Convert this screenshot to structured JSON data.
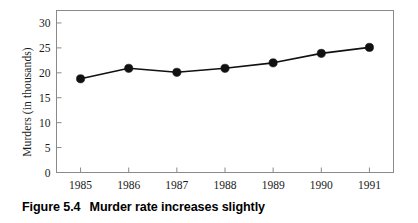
{
  "figure": {
    "caption_number": "Figure 5.4",
    "caption_text": "Murder rate increases slightly"
  },
  "axes": {
    "y_title": "Murders (in thousands)",
    "y_ticks": [
      "0",
      "5",
      "10",
      "15",
      "20",
      "25",
      "30"
    ],
    "x_ticks": [
      "1985",
      "1986",
      "1987",
      "1988",
      "1989",
      "1990",
      "1991"
    ]
  },
  "colors": {
    "frame": "#8a8a8a",
    "line": "#111111",
    "marker": "#111111",
    "background": "#ffffff",
    "text": "#1a1a1a"
  },
  "chart_data": {
    "type": "line",
    "title": "Murder rate increases slightly",
    "xlabel": "",
    "ylabel": "Murders (in thousands)",
    "categories": [
      "1985",
      "1986",
      "1987",
      "1988",
      "1989",
      "1990",
      "1991"
    ],
    "x": [
      1985,
      1986,
      1987,
      1988,
      1989,
      1990,
      1991
    ],
    "values": [
      18.8,
      20.9,
      20.1,
      20.9,
      22.0,
      23.9,
      25.1
    ],
    "series": [
      {
        "name": "Murders",
        "values": [
          18.8,
          20.9,
          20.1,
          20.9,
          22.0,
          23.9,
          25.1
        ]
      }
    ],
    "ylim": [
      0,
      32.5
    ],
    "yticks": [
      0,
      5,
      10,
      15,
      20,
      25,
      30
    ],
    "xlim": [
      1984.5,
      1991.5
    ],
    "grid": false,
    "legend": "none",
    "markers": "filled-circle"
  }
}
